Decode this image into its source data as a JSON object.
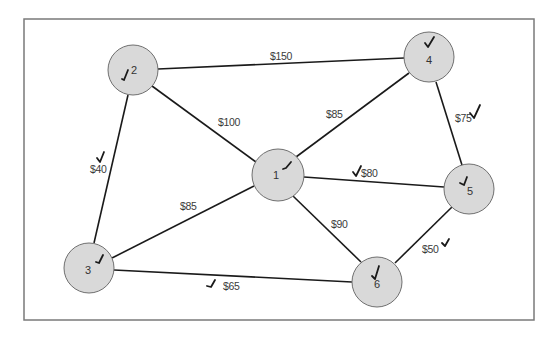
{
  "diagram": {
    "type": "weighted-network-graph",
    "frame": {
      "x": 24,
      "y": 19,
      "width": 510,
      "height": 301,
      "stroke": "#7a7a7a"
    },
    "colors": {
      "node_fill": "#d9d9d9",
      "node_stroke": "#6f6f6f",
      "edge": "#1a1a1a",
      "label": "#3a3a3a",
      "check": "#1a1a1a"
    },
    "nodes": [
      {
        "id": "1",
        "label": "1",
        "cx": 278,
        "cy": 175,
        "r": 26,
        "checked": true
      },
      {
        "id": "2",
        "label": "2",
        "cx": 133,
        "cy": 70,
        "r": 25,
        "checked": true
      },
      {
        "id": "3",
        "label": "3",
        "cx": 89,
        "cy": 268,
        "r": 25,
        "checked": true
      },
      {
        "id": "4",
        "label": "4",
        "cx": 429,
        "cy": 57,
        "r": 25,
        "checked": true
      },
      {
        "id": "5",
        "label": "5",
        "cx": 469,
        "cy": 189,
        "r": 25,
        "checked": true
      },
      {
        "id": "6",
        "label": "6",
        "cx": 377,
        "cy": 282,
        "r": 25,
        "checked": true
      }
    ],
    "edges": [
      {
        "from": "2",
        "to": "4",
        "cost": "$150",
        "checked": false
      },
      {
        "from": "2",
        "to": "1",
        "cost": "$100",
        "checked": false
      },
      {
        "from": "2",
        "to": "3",
        "cost": "$40",
        "checked": true
      },
      {
        "from": "1",
        "to": "4",
        "cost": "$85",
        "checked": false
      },
      {
        "from": "1",
        "to": "3",
        "cost": "$85",
        "checked": false
      },
      {
        "from": "1",
        "to": "5",
        "cost": "$80",
        "checked": true
      },
      {
        "from": "1",
        "to": "6",
        "cost": "$90",
        "checked": false
      },
      {
        "from": "4",
        "to": "5",
        "cost": "$75",
        "checked": true
      },
      {
        "from": "5",
        "to": "6",
        "cost": "$50",
        "checked": true
      },
      {
        "from": "3",
        "to": "6",
        "cost": "$65",
        "checked": true
      }
    ]
  }
}
